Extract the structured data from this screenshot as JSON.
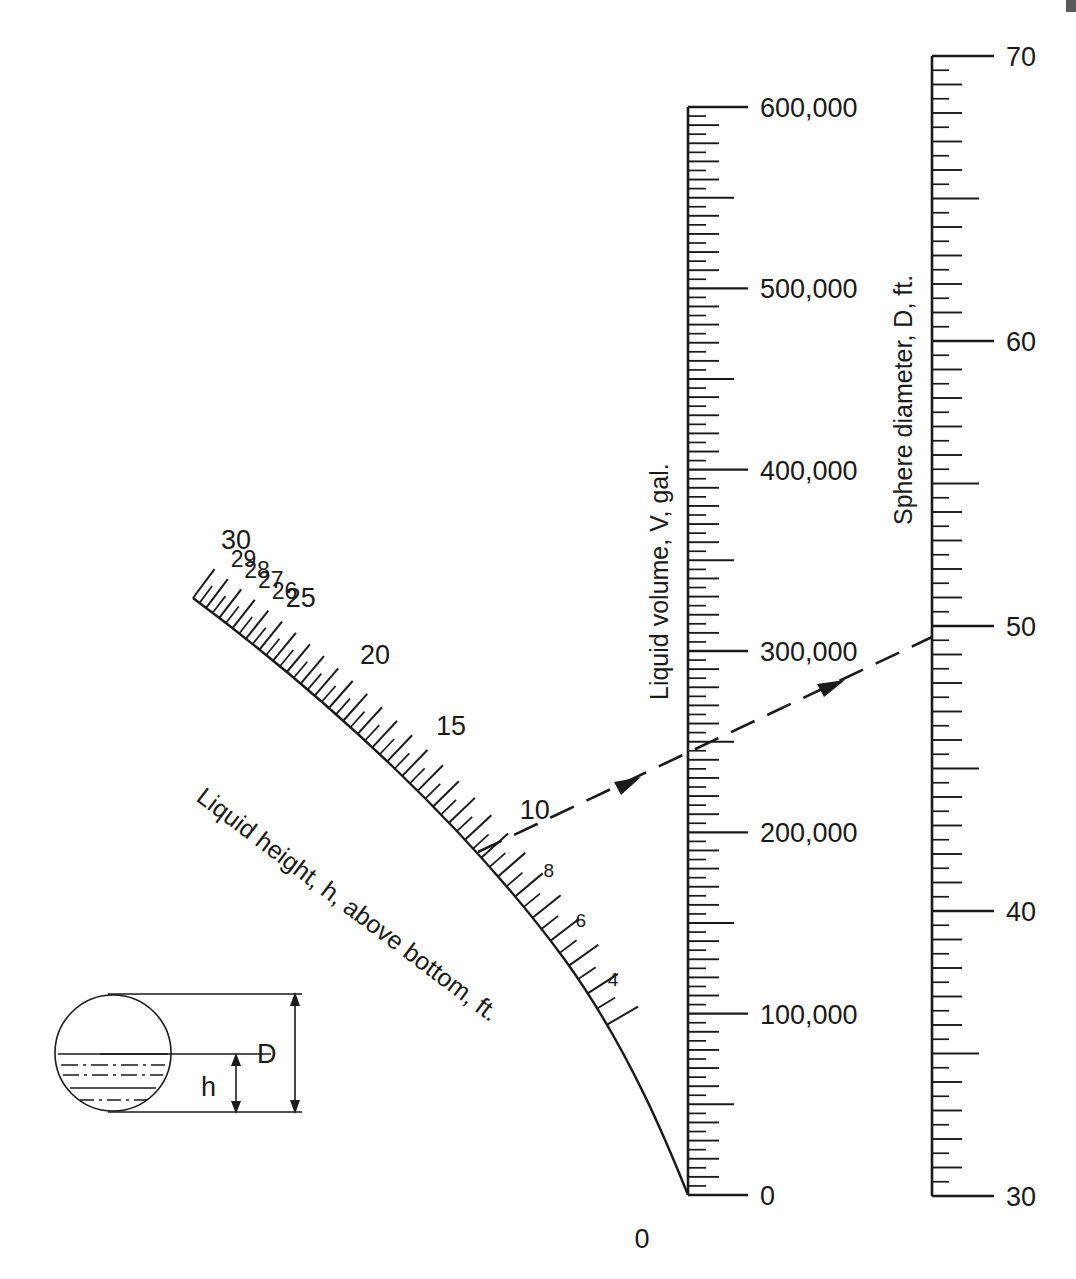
{
  "figure": {
    "type": "nomograph",
    "background_color": "#ffffff",
    "line_color": "#1a1a1a"
  },
  "scales": {
    "height": {
      "title": "Liquid height, h, above bottom, ft.",
      "units": "ft",
      "symbol": "h",
      "shape": "curved",
      "labels": [
        "30",
        "29",
        "28",
        "27",
        "26",
        "25",
        "20",
        "15",
        "10",
        "8",
        "6",
        "4",
        "0"
      ],
      "label_values": [
        30,
        29,
        28,
        27,
        26,
        25,
        20,
        15,
        10,
        8,
        6,
        4,
        0
      ],
      "range": [
        0,
        30
      ],
      "minor_tick_step": 0.5,
      "major_tick_step": 1
    },
    "volume": {
      "title": "Liquid volume, V, gal.",
      "units": "gal",
      "symbol": "V",
      "shape": "vertical",
      "labels": [
        "600,000",
        "500,000",
        "400,000",
        "300,000",
        "200,000",
        "100,000",
        "0"
      ],
      "label_values": [
        600000,
        500000,
        400000,
        300000,
        200000,
        100000,
        0
      ],
      "range": [
        0,
        600000
      ],
      "minor_tick_step": 5000,
      "mid_tick_step": 10000,
      "half_tick_step": 50000,
      "major_tick_step": 100000
    },
    "diameter": {
      "title": "Sphere diameter, D, ft.",
      "units": "ft",
      "symbol": "D",
      "shape": "vertical",
      "labels": [
        "70",
        "60",
        "50",
        "40",
        "30"
      ],
      "label_values": [
        70,
        60,
        50,
        40,
        30
      ],
      "range": [
        30,
        70
      ],
      "minor_tick_step": 0.5,
      "mid_tick_step": 1,
      "half_tick_step": 5,
      "major_tick_step": 10
    }
  },
  "index_line": {
    "style": "dashed",
    "arrowheads": 2,
    "direction": "left-to-right",
    "readings": {
      "height_h": 26,
      "volume_v": 250000,
      "diameter_d": 50
    }
  },
  "inset_diagram": {
    "name": "sphere-cross-section",
    "shape": "circle",
    "dimension_labels": [
      "D",
      "h"
    ],
    "liquid_level_lines": 4
  },
  "chart_data": {
    "type": "line",
    "xlabel": "",
    "ylabel": "",
    "axes": [
      {
        "name": "Liquid height, h, above bottom, ft.",
        "ticks": [
          0,
          4,
          6,
          8,
          10,
          15,
          20,
          25,
          26,
          27,
          28,
          29,
          30
        ],
        "range": [
          0,
          30
        ]
      },
      {
        "name": "Liquid volume, V, gal.",
        "ticks": [
          0,
          100000,
          200000,
          300000,
          400000,
          500000,
          600000
        ],
        "range": [
          0,
          600000
        ]
      },
      {
        "name": "Sphere diameter, D, ft.",
        "ticks": [
          30,
          40,
          50,
          60,
          70
        ],
        "range": [
          30,
          70
        ]
      }
    ],
    "annotations": [
      {
        "label": "index line reading h",
        "value": 26
      },
      {
        "label": "index line reading V",
        "value": 250000
      },
      {
        "label": "index line reading D",
        "value": 50
      }
    ],
    "grid": false,
    "legend": "none"
  }
}
